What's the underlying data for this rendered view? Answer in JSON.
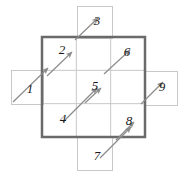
{
  "figure": {
    "title": "",
    "type": "diagram",
    "canvas": {
      "width": 187,
      "height": 179,
      "background": "#ffffff"
    },
    "colors": {
      "outer_square_stroke": "#6a6a6a",
      "grid_line_stroke": "#c8c8c8",
      "extension_cell_stroke": "#c8c8c8",
      "arrow_stroke": "#8c8c8c",
      "label_color": "#1a1a1a"
    },
    "outer_square": {
      "x": 42,
      "y": 37,
      "width": 103,
      "height": 100,
      "stroke_width": 2.5
    },
    "grid": {
      "rows": 3,
      "cols": 3
    },
    "extension_cells": [
      {
        "name": "top-cell",
        "x": 77,
        "y": 6,
        "width": 35,
        "height": 32
      },
      {
        "name": "left-cell",
        "x": 11,
        "y": 70,
        "width": 32,
        "height": 34
      },
      {
        "name": "right-cell",
        "x": 144,
        "y": 71,
        "width": 33,
        "height": 34
      },
      {
        "name": "bottom-cell",
        "x": 77,
        "y": 136,
        "width": 35,
        "height": 34
      }
    ],
    "arrows": [
      {
        "id": 1,
        "label": "1",
        "x1": 13,
        "y1": 102,
        "x2": 48,
        "y2": 68,
        "label_x": 30,
        "label_y": 88
      },
      {
        "id": 2,
        "label": "2",
        "x1": 47,
        "y1": 76,
        "x2": 72,
        "y2": 52,
        "label_x": 62,
        "label_y": 49
      },
      {
        "id": 3,
        "label": "3",
        "x1": 75,
        "y1": 40,
        "x2": 98,
        "y2": 18,
        "label_x": 97,
        "label_y": 20
      },
      {
        "id": 4,
        "label": "4",
        "x1": 63,
        "y1": 122,
        "x2": 97,
        "y2": 88,
        "label_x": 63,
        "label_y": 118
      },
      {
        "id": 5,
        "label": "5",
        "x1": 85,
        "y1": 103,
        "x2": 101,
        "y2": 88,
        "label_x": 95,
        "label_y": 85
      },
      {
        "id": 6,
        "label": "6",
        "x1": 104,
        "y1": 74,
        "x2": 130,
        "y2": 50,
        "label_x": 127,
        "label_y": 51
      },
      {
        "id": 7,
        "label": "7",
        "x1": 100,
        "y1": 158,
        "x2": 131,
        "y2": 127,
        "label_x": 97,
        "label_y": 155
      },
      {
        "id": 8,
        "label": "8",
        "x1": 116,
        "y1": 140,
        "x2": 134,
        "y2": 122,
        "label_x": 129,
        "label_y": 120
      },
      {
        "id": 9,
        "label": "9",
        "x1": 141,
        "y1": 104,
        "x2": 163,
        "y2": 82,
        "label_x": 162,
        "label_y": 86
      }
    ]
  }
}
